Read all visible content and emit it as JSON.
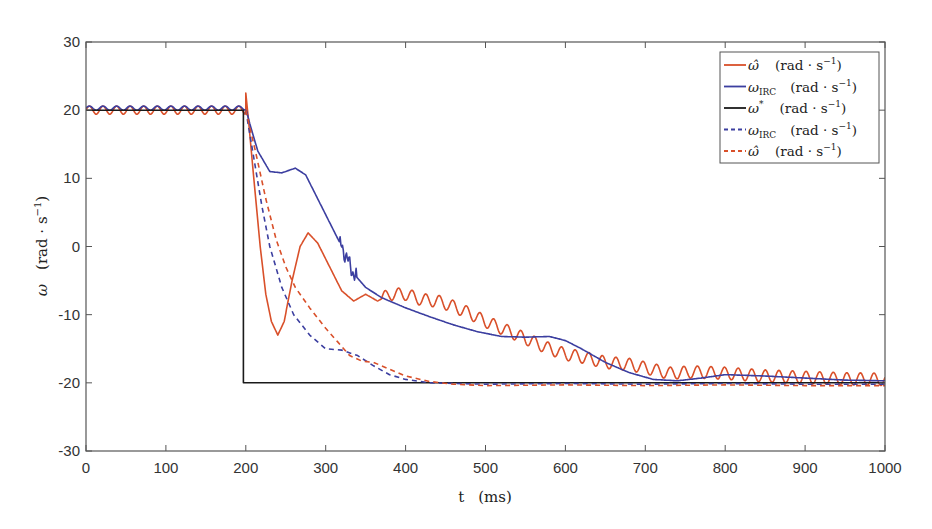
{
  "chart_data": {
    "type": "line",
    "title": "",
    "xlabel": "t   (ms)",
    "ylabel": "ω   (rad · s⁻¹)",
    "xlim": [
      0,
      1000
    ],
    "ylim": [
      -30,
      30
    ],
    "xticks": [
      0,
      100,
      200,
      300,
      400,
      500,
      600,
      700,
      800,
      900,
      1000
    ],
    "yticks": [
      -30,
      -20,
      -10,
      0,
      10,
      20,
      30
    ],
    "grid": false,
    "legend_position": "upper right",
    "series": [
      {
        "name": "ω̂ (rad·s⁻¹)",
        "legend_symbol": "ω̂",
        "legend_sub": "",
        "color": "#d9502a",
        "style": "solid",
        "points": [
          [
            0,
            20
          ],
          [
            200,
            20
          ],
          [
            200,
            22.5
          ],
          [
            203,
            19
          ],
          [
            210,
            10
          ],
          [
            218,
            0
          ],
          [
            225,
            -7
          ],
          [
            232,
            -11
          ],
          [
            240,
            -13
          ],
          [
            248,
            -11
          ],
          [
            258,
            -5
          ],
          [
            268,
            0
          ],
          [
            278,
            2
          ],
          [
            290,
            0.5
          ],
          [
            305,
            -3
          ],
          [
            320,
            -6.5
          ],
          [
            335,
            -8
          ],
          [
            350,
            -7
          ],
          [
            365,
            -8
          ],
          [
            380,
            -7
          ],
          [
            400,
            -7
          ],
          [
            420,
            -7.8
          ],
          [
            440,
            -8
          ],
          [
            460,
            -8.8
          ],
          [
            480,
            -9.8
          ],
          [
            500,
            -11
          ],
          [
            520,
            -12
          ],
          [
            540,
            -13
          ],
          [
            560,
            -14
          ],
          [
            580,
            -15
          ],
          [
            600,
            -15.8
          ],
          [
            620,
            -16.2
          ],
          [
            650,
            -17
          ],
          [
            680,
            -17.3
          ],
          [
            700,
            -17.8
          ],
          [
            730,
            -18.6
          ],
          [
            760,
            -18.4
          ],
          [
            800,
            -18.6
          ],
          [
            850,
            -19
          ],
          [
            900,
            -19.2
          ],
          [
            950,
            -19.4
          ],
          [
            1000,
            -19.5
          ]
        ],
        "oscillation": {
          "from": 0,
          "to": 200,
          "amplitude": 0.6,
          "period": 17
        },
        "oscillation2": {
          "from": 370,
          "to": 1000,
          "amplitude": 0.9,
          "period": 17
        }
      },
      {
        "name": "ω_IRC (rad·s⁻¹)",
        "legend_symbol": "ω",
        "legend_sub": "IRC",
        "color": "#3c3fa0",
        "style": "solid",
        "points": [
          [
            0,
            20.3
          ],
          [
            200,
            20.3
          ],
          [
            205,
            18
          ],
          [
            215,
            14
          ],
          [
            230,
            11
          ],
          [
            245,
            10.8
          ],
          [
            262,
            11.5
          ],
          [
            275,
            10.5
          ],
          [
            290,
            7
          ],
          [
            305,
            3.5
          ],
          [
            320,
            0
          ],
          [
            335,
            -4
          ],
          [
            350,
            -6
          ],
          [
            370,
            -7.5
          ],
          [
            400,
            -9
          ],
          [
            430,
            -10.3
          ],
          [
            460,
            -11.5
          ],
          [
            490,
            -12.5
          ],
          [
            520,
            -13.2
          ],
          [
            550,
            -13.3
          ],
          [
            580,
            -13.2
          ],
          [
            600,
            -13.8
          ],
          [
            620,
            -15
          ],
          [
            650,
            -17
          ],
          [
            680,
            -18.5
          ],
          [
            710,
            -19.5
          ],
          [
            740,
            -19.7
          ],
          [
            770,
            -19.3
          ],
          [
            800,
            -18.8
          ],
          [
            850,
            -19
          ],
          [
            900,
            -19.3
          ],
          [
            950,
            -19.6
          ],
          [
            1000,
            -19.7
          ]
        ],
        "oscillation": {
          "from": 0,
          "to": 200,
          "amplitude": 0.3,
          "period": 17
        },
        "jitter": {
          "from": 318,
          "to": 338,
          "amplitude": 1.2
        }
      },
      {
        "name": "ω* (rad·s⁻¹)",
        "legend_symbol": "ω",
        "legend_sup": "*",
        "color": "#1a1a1a",
        "style": "solid",
        "points": [
          [
            0,
            20
          ],
          [
            197,
            20
          ],
          [
            197,
            -20
          ],
          [
            1000,
            -20
          ]
        ],
        "note": "reference: 20 until 197 ms then step to -20 (visible portion from 197)"
      },
      {
        "name": "ω_IRC (rad·s⁻¹) dashed",
        "legend_symbol": "ω",
        "legend_sub": "IRC",
        "color": "#3c3fa0",
        "style": "dashed",
        "points": [
          [
            200,
            20
          ],
          [
            210,
            13
          ],
          [
            220,
            6
          ],
          [
            230,
            0
          ],
          [
            245,
            -6
          ],
          [
            260,
            -10
          ],
          [
            280,
            -13
          ],
          [
            300,
            -15
          ],
          [
            320,
            -15.2
          ],
          [
            340,
            -16
          ],
          [
            360,
            -17.5
          ],
          [
            380,
            -18.8
          ],
          [
            400,
            -19.5
          ],
          [
            430,
            -20
          ],
          [
            500,
            -20.2
          ],
          [
            600,
            -20.1
          ],
          [
            700,
            -20.2
          ],
          [
            800,
            -20.1
          ],
          [
            900,
            -20.2
          ],
          [
            1000,
            -20.2
          ]
        ]
      },
      {
        "name": "ω̂ (rad·s⁻¹) dashed",
        "legend_symbol": "ω̂",
        "legend_sub": "",
        "color": "#d9502a",
        "style": "dashed",
        "points": [
          [
            200,
            20
          ],
          [
            212,
            14
          ],
          [
            225,
            7
          ],
          [
            238,
            1
          ],
          [
            250,
            -3
          ],
          [
            262,
            -6
          ],
          [
            280,
            -9
          ],
          [
            300,
            -12
          ],
          [
            315,
            -14
          ],
          [
            330,
            -16
          ],
          [
            345,
            -16.8
          ],
          [
            360,
            -17
          ],
          [
            380,
            -18
          ],
          [
            400,
            -19
          ],
          [
            430,
            -19.8
          ],
          [
            460,
            -20.2
          ],
          [
            500,
            -20.4
          ],
          [
            600,
            -20.3
          ],
          [
            700,
            -20.4
          ],
          [
            800,
            -20.3
          ],
          [
            900,
            -20.4
          ],
          [
            1000,
            -20.4
          ]
        ]
      }
    ],
    "legend": [
      {
        "symbol": "ω̂",
        "sub": "",
        "sup": "",
        "unit": "(rad · s",
        "exp": "−1",
        "close": ")",
        "color": "#d9502a",
        "style": "solid"
      },
      {
        "symbol": "ω",
        "sub": "IRC",
        "sup": "",
        "unit": "(rad · s",
        "exp": "−1",
        "close": ")",
        "color": "#3c3fa0",
        "style": "solid"
      },
      {
        "symbol": "ω",
        "sub": "",
        "sup": "*",
        "unit": "(rad · s",
        "exp": "−1",
        "close": ")",
        "color": "#1a1a1a",
        "style": "solid"
      },
      {
        "symbol": "ω",
        "sub": "IRC",
        "sup": "",
        "unit": "(rad · s",
        "exp": "−1",
        "close": ")",
        "color": "#3c3fa0",
        "style": "dashed"
      },
      {
        "symbol": "ω̂",
        "sub": "",
        "sup": "",
        "unit": "(rad · s",
        "exp": "−1",
        "close": ")",
        "color": "#d9502a",
        "style": "dashed"
      }
    ]
  },
  "axis": {
    "xlabel_t": "t",
    "xlabel_unit": "(ms)",
    "ylabel_sym": "ω",
    "ylabel_unit": "(rad · s",
    "ylabel_exp": "−1",
    "ylabel_close": ")"
  }
}
